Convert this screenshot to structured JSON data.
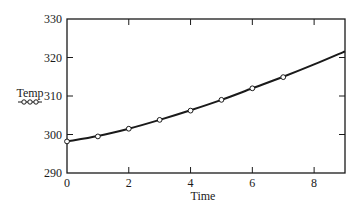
{
  "chart_data": {
    "type": "line",
    "title": "",
    "xlabel": "Time",
    "ylabel": "Temp",
    "xlim": [
      0,
      9
    ],
    "ylim": [
      290,
      330
    ],
    "x_ticks": [
      0,
      2,
      4,
      6,
      8
    ],
    "y_ticks": [
      290,
      300,
      310,
      320,
      330
    ],
    "grid": false,
    "legend": {
      "position": "left-of-y-axis",
      "entries": [
        {
          "label": "Temp",
          "marker": "open-circle-line"
        }
      ]
    },
    "series": [
      {
        "name": "Temp (markers)",
        "style": "open-circle markers",
        "x": [
          0,
          1,
          2,
          3,
          4,
          5,
          6,
          7
        ],
        "y": [
          298.2,
          299.5,
          301.5,
          303.8,
          306.2,
          309.0,
          312.0,
          314.9
        ]
      },
      {
        "name": "Temp (fitted curve)",
        "style": "solid line",
        "x": [
          0,
          1,
          2,
          3,
          4,
          5,
          6,
          7,
          8,
          9
        ],
        "y": [
          298.2,
          299.6,
          301.5,
          303.8,
          306.3,
          309.0,
          312.0,
          315.0,
          318.2,
          321.6
        ]
      }
    ]
  },
  "labels": {
    "xlabel": "Time",
    "ylabel": "Temp",
    "x_ticks": [
      "0",
      "2",
      "4",
      "6",
      "8"
    ],
    "y_ticks": [
      "290",
      "300",
      "310",
      "320",
      "330"
    ]
  },
  "colors": {
    "line": "#1a1a1a",
    "marker_fill": "#ffffff",
    "axis": "#1a1a1a"
  }
}
